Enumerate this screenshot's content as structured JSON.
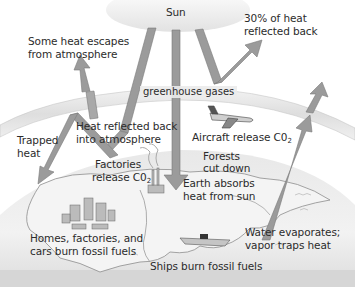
{
  "diagram": {
    "sun_label": "Sun",
    "atmosphere_label": "greenhouse gases",
    "labels": {
      "heat_escapes_1": "Some heat escapes",
      "heat_escapes_2": "from atmosphere",
      "reflected_1": "30% of heat",
      "reflected_2": "reflected back",
      "trapped_1": "Trapped",
      "trapped_2": "heat",
      "reflected_atm_1": "Heat reflected back",
      "reflected_atm_2": "into atmosphere",
      "aircraft": "Aircraft release C0",
      "aircraft_sub": "2",
      "factories_1": "Factories",
      "factories_2": "release C0",
      "factories_sub": "2",
      "forests_1": "Forests",
      "forests_2": "cut down",
      "earth_absorbs_1": "Earth absorbs",
      "earth_absorbs_2": "heat from sun",
      "homes_1": "Homes, factories, and",
      "homes_2": "cars burn fossil fuels",
      "ships": "Ships burn fossil fuels",
      "water_1": "Water evaporates;",
      "water_2": "vapor traps heat"
    },
    "colors": {
      "arrow_fill": "#9a9a9a",
      "arrow_edge": "#7a7a7a",
      "sun": "#ececec",
      "atmosphere_band": "#e4e4e4",
      "earth": "#eeeeee",
      "land_outline": "#8a8a8a"
    }
  }
}
